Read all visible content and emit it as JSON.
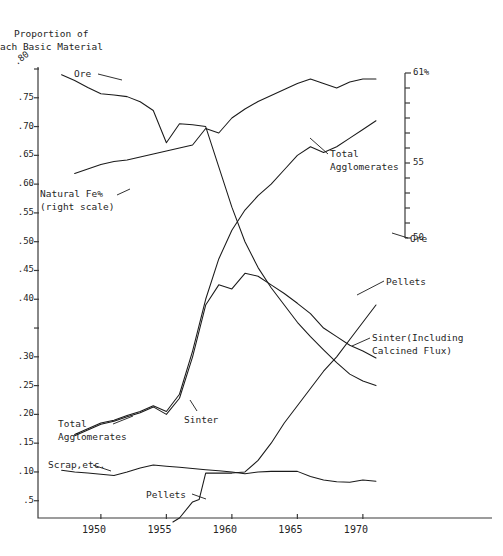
{
  "title": {
    "line1": "Proportion of",
    "line2": "ach Basic Material"
  },
  "axes": {
    "y_left": {
      "ticks": [
        ".80",
        ".75",
        ".70",
        ".65",
        ".60",
        ".55",
        ".50",
        ".45",
        ".40",
        "",
        ".30",
        ".25",
        ".20",
        ".15",
        ".10",
        ".5"
      ],
      "tick_values": [
        0.8,
        0.75,
        0.7,
        0.65,
        0.6,
        0.55,
        0.5,
        0.45,
        0.4,
        0.35,
        0.3,
        0.25,
        0.2,
        0.15,
        0.1,
        0.05
      ],
      "range": [
        0.02,
        0.8
      ]
    },
    "y_right": {
      "top_label": "61%",
      "mid_label": "55",
      "bottom_label": "50",
      "range": [
        50,
        61
      ],
      "tick_step": 1
    },
    "x": {
      "ticks": [
        "1950",
        "1955",
        "1960",
        "1965",
        "1970"
      ],
      "tick_values": [
        1950,
        1955,
        1960,
        1965,
        1970
      ],
      "range": [
        1945.2,
        1972.3
      ]
    }
  },
  "series_labels": {
    "ore_top": "Ore",
    "natural_fe": "Natural Fe%\n(right scale)",
    "total_agg_right": "Total\nAgglomerates",
    "total_agg_left": "Total\nAgglomerates",
    "sinter_left": "Sinter",
    "pellets_right": "Pellets",
    "sinter_right": "Sinter(Including\nCalcined Flux)",
    "ore_right": "Ore",
    "scrap": "Scrap,etc.",
    "pellets_bottom": "Pellets"
  },
  "colors": {
    "ink": "#1a1a1a",
    "axis": "#3a3a3a",
    "background": "#ffffff"
  },
  "chart_data": {
    "type": "line",
    "xlabel": "",
    "ylabel": "Proportion of Each Basic Material",
    "xlim": [
      1945.2,
      1972.3
    ],
    "ylim": [
      0.02,
      0.8
    ],
    "y2lim": [
      50,
      61
    ],
    "y2label": "Natural Fe%",
    "grid": false,
    "legend": "inline-annotations",
    "series": [
      {
        "name": "Ore",
        "axis": "left",
        "x": [
          1947.0,
          1948.0,
          1949.0,
          1950.0,
          1951.0,
          1952.0,
          1953.0,
          1954.0,
          1955.0,
          1956.0,
          1957.0,
          1958.0,
          1959.0,
          1960.0,
          1961.0,
          1962.0,
          1963.0,
          1964.0,
          1965.0,
          1966.0,
          1967.0,
          1968.0,
          1969.0,
          1970.0,
          1971.0
        ],
        "y": [
          0.79,
          0.78,
          0.768,
          0.757,
          0.755,
          0.752,
          0.743,
          0.728,
          0.672,
          0.705,
          0.703,
          0.7,
          0.63,
          0.56,
          0.5,
          0.455,
          0.42,
          0.39,
          0.36,
          0.335,
          0.312,
          0.29,
          0.27,
          0.258,
          0.25
        ]
      },
      {
        "name": "Natural Fe%",
        "axis": "right",
        "x": [
          1948.0,
          1949.0,
          1950.0,
          1951.0,
          1952.0,
          1953.0,
          1954.0,
          1955.0,
          1956.0,
          1957.0,
          1958.0,
          1959.0,
          1960.0,
          1961.0,
          1962.0,
          1963.0,
          1964.0,
          1965.0,
          1966.0,
          1967.0,
          1968.0,
          1969.0,
          1970.0,
          1971.0
        ],
        "y": [
          54.3,
          54.6,
          54.9,
          55.1,
          55.2,
          55.4,
          55.6,
          55.8,
          56.0,
          56.2,
          57.3,
          57.0,
          58.0,
          58.6,
          59.1,
          59.5,
          59.9,
          60.3,
          60.6,
          60.3,
          60.0,
          60.4,
          60.6,
          60.6
        ]
      },
      {
        "name": "Total Agglomerates",
        "axis": "left",
        "x": [
          1948.0,
          1949.0,
          1950.0,
          1951.0,
          1952.0,
          1953.0,
          1954.0,
          1955.0,
          1956.0,
          1957.0,
          1958.0,
          1959.0,
          1960.0,
          1961.0,
          1962.0,
          1963.0,
          1964.0,
          1965.0,
          1966.0,
          1967.0,
          1968.0,
          1969.0,
          1970.0,
          1971.0
        ],
        "y": [
          0.165,
          0.175,
          0.185,
          0.19,
          0.198,
          0.205,
          0.215,
          0.205,
          0.235,
          0.31,
          0.4,
          0.47,
          0.52,
          0.555,
          0.58,
          0.6,
          0.625,
          0.65,
          0.665,
          0.655,
          0.665,
          0.68,
          0.695,
          0.71
        ]
      },
      {
        "name": "Sinter (Including Calcined Flux)",
        "axis": "left",
        "x": [
          1948.0,
          1949.0,
          1950.0,
          1951.0,
          1952.0,
          1953.0,
          1954.0,
          1955.0,
          1956.0,
          1957.0,
          1958.0,
          1959.0,
          1960.0,
          1961.0,
          1962.0,
          1963.0,
          1964.0,
          1965.0,
          1966.0,
          1967.0,
          1968.0,
          1969.0,
          1970.0,
          1971.0
        ],
        "y": [
          0.163,
          0.173,
          0.183,
          0.188,
          0.196,
          0.203,
          0.213,
          0.2,
          0.228,
          0.3,
          0.39,
          0.425,
          0.418,
          0.445,
          0.44,
          0.425,
          0.41,
          0.393,
          0.375,
          0.35,
          0.335,
          0.32,
          0.31,
          0.298
        ]
      },
      {
        "name": "Pellets",
        "axis": "left",
        "x": [
          1955.5,
          1956.0,
          1957.0,
          1957.5,
          1958.0,
          1959.0,
          1960.0,
          1961.0,
          1962.0,
          1963.0,
          1964.0,
          1965.0,
          1966.0,
          1967.0,
          1968.0,
          1969.0,
          1970.0,
          1971.0
        ],
        "y": [
          0.013,
          0.02,
          0.048,
          0.052,
          0.098,
          0.098,
          0.098,
          0.1,
          0.12,
          0.15,
          0.185,
          0.215,
          0.245,
          0.275,
          0.3,
          0.33,
          0.36,
          0.39
        ]
      },
      {
        "name": "Scrap, etc.",
        "axis": "left",
        "x": [
          1947.0,
          1948.0,
          1949.0,
          1950.0,
          1951.0,
          1952.0,
          1953.0,
          1954.0,
          1955.0,
          1956.0,
          1957.0,
          1958.0,
          1959.0,
          1960.0,
          1961.0,
          1962.0,
          1963.0,
          1964.0,
          1965.0,
          1966.0,
          1967.0,
          1968.0,
          1969.0,
          1970.0,
          1971.0
        ],
        "y": [
          0.103,
          0.1,
          0.098,
          0.096,
          0.094,
          0.1,
          0.107,
          0.112,
          0.11,
          0.108,
          0.106,
          0.104,
          0.102,
          0.1,
          0.097,
          0.1,
          0.101,
          0.101,
          0.101,
          0.092,
          0.086,
          0.083,
          0.082,
          0.086,
          0.084
        ]
      }
    ],
    "annotations": [
      {
        "text": "Ore",
        "x": 1948.4,
        "y": 0.787
      },
      {
        "text": "Natural Fe% (right scale)",
        "x": 1946.0,
        "y": 0.553
      },
      {
        "text": "Total Agglomerates",
        "x": 1963.2,
        "y": 0.612
      },
      {
        "text": "Total Agglomerates",
        "x": 1946.6,
        "y": 0.152
      },
      {
        "text": "Sinter",
        "x": 1954.8,
        "y": 0.172
      },
      {
        "text": "Pellets",
        "x": 1971.2,
        "y": 0.402
      },
      {
        "text": "Sinter(Including Calcined Flux)",
        "x": 1971.2,
        "y": 0.33
      },
      {
        "text": "Ore",
        "x": 1971.6,
        "y": 0.252
      },
      {
        "text": "Scrap,etc.",
        "x": 1947.2,
        "y": 0.093
      },
      {
        "text": "Pellets",
        "x": 1954.0,
        "y": 0.037
      }
    ]
  }
}
